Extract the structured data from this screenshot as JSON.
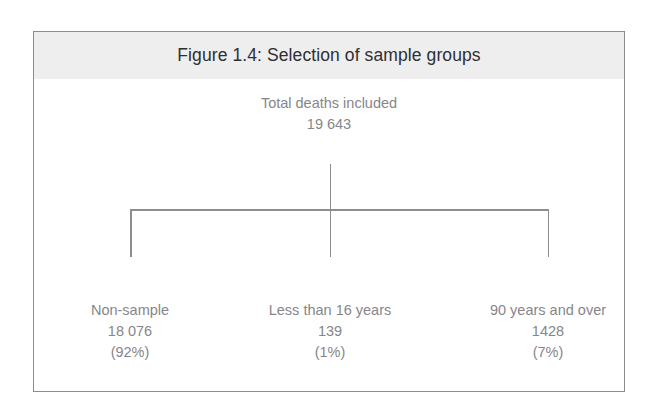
{
  "figure": {
    "title": "Figure 1.4: Selection of sample groups",
    "border_color": "#8d8d8f",
    "title_band_color": "#eeeeef",
    "title_text_color": "#2f2f31",
    "body_text_color": "#86868a"
  },
  "chart_data": {
    "type": "diagram",
    "title": "Figure 1.4: Selection of sample groups",
    "orientation": "top-down",
    "root": {
      "label": "Total deaths included",
      "value": "19 643",
      "percent": ""
    },
    "children": [
      {
        "label": "Non-sample",
        "value": "18 076",
        "percent": "(92%)"
      },
      {
        "label": "Less than 16 years",
        "value": "139",
        "percent": "(1%)"
      },
      {
        "label": "90 years and over",
        "value": "1428",
        "percent": "(7%)"
      }
    ]
  }
}
